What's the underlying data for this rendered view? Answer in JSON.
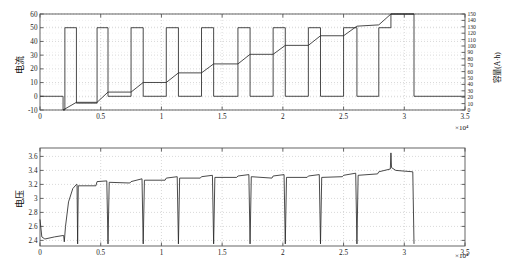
{
  "figure": {
    "background": "#ffffff",
    "line_color": "#2b2b2b",
    "grid_color": "#bdbdbd",
    "axis_color": "#555555"
  },
  "panels": [
    {
      "id": "current",
      "ylabel_left": "电流",
      "ylabel_right": "容量(A·h)",
      "exponent_label": "×10⁴"
    },
    {
      "id": "voltage",
      "ylabel_left": "电压",
      "exponent_label": "×10⁴"
    }
  ],
  "chart_data": [
    {
      "type": "line",
      "title": "",
      "xlabel": "",
      "ylabel": "电流",
      "y2label": "容量(A·h)",
      "grid": true,
      "legend": "none",
      "xlim": [
        0,
        35000
      ],
      "ylim": [
        -10,
        60
      ],
      "y2lim": [
        0,
        150
      ],
      "x_exponent": "×10⁴",
      "xticks": [
        0,
        5000,
        10000,
        15000,
        20000,
        25000,
        30000,
        35000
      ],
      "xticklabels": [
        "0",
        "0.5",
        "1",
        "1.5",
        "2",
        "2.5",
        "3",
        "3.5"
      ],
      "yticks": [
        -10,
        0,
        10,
        20,
        30,
        40,
        50,
        60
      ],
      "yticklabels": [
        "-10",
        "0",
        "10",
        "20",
        "30",
        "40",
        "50",
        "60"
      ],
      "y2ticks": [
        0,
        10,
        20,
        30,
        40,
        50,
        60,
        70,
        80,
        90,
        100,
        110,
        120,
        130,
        140,
        150
      ],
      "y2ticklabels": [
        "0",
        "10",
        "20",
        "30",
        "40",
        "50",
        "60",
        "70",
        "80",
        "90",
        "100",
        "110",
        "120",
        "130",
        "140",
        "150"
      ],
      "series": [
        {
          "name": "电流",
          "axis": "left",
          "description": "Rectangular discharge-pulse current train, baseline 0 A with 50 A pulses; final pulse reaches 60 A",
          "points": [
            [
              0,
              0
            ],
            [
              1900,
              0
            ],
            [
              1900,
              -10
            ],
            [
              2050,
              -10
            ],
            [
              2050,
              50
            ],
            [
              3000,
              50
            ],
            [
              3000,
              -5
            ],
            [
              4700,
              -5
            ],
            [
              4700,
              50
            ],
            [
              5600,
              50
            ],
            [
              5600,
              0
            ],
            [
              7500,
              0
            ],
            [
              7500,
              50
            ],
            [
              8500,
              50
            ],
            [
              8500,
              0
            ],
            [
              10400,
              0
            ],
            [
              10400,
              50
            ],
            [
              11400,
              50
            ],
            [
              11400,
              0
            ],
            [
              13300,
              0
            ],
            [
              13300,
              50
            ],
            [
              14300,
              50
            ],
            [
              14300,
              0
            ],
            [
              16300,
              0
            ],
            [
              16300,
              50
            ],
            [
              17300,
              50
            ],
            [
              17300,
              0
            ],
            [
              19200,
              0
            ],
            [
              19200,
              50
            ],
            [
              20200,
              50
            ],
            [
              20200,
              0
            ],
            [
              22100,
              0
            ],
            [
              22100,
              50
            ],
            [
              23100,
              50
            ],
            [
              23100,
              0
            ],
            [
              25000,
              0
            ],
            [
              25000,
              50
            ],
            [
              26100,
              50
            ],
            [
              26100,
              0
            ],
            [
              27900,
              0
            ],
            [
              27900,
              50
            ],
            [
              28900,
              50
            ],
            [
              28900,
              60
            ],
            [
              30800,
              60
            ],
            [
              30800,
              0
            ],
            [
              35000,
              0
            ]
          ]
        },
        {
          "name": "容量",
          "axis": "right",
          "description": "Monotonic staircase of accumulated capacity rising from 0 to ~150 A·h",
          "points": [
            [
              1900,
              0
            ],
            [
              3000,
              12
            ],
            [
              4700,
              12
            ],
            [
              5600,
              28
            ],
            [
              7500,
              28
            ],
            [
              8500,
              43
            ],
            [
              10400,
              43
            ],
            [
              11400,
              58
            ],
            [
              13300,
              58
            ],
            [
              14300,
              72
            ],
            [
              16300,
              72
            ],
            [
              17300,
              87
            ],
            [
              19200,
              87
            ],
            [
              20200,
              101
            ],
            [
              22100,
              101
            ],
            [
              23100,
              116
            ],
            [
              25000,
              116
            ],
            [
              26100,
              131
            ],
            [
              27900,
              133
            ],
            [
              28900,
              150
            ],
            [
              30800,
              150
            ]
          ]
        }
      ]
    },
    {
      "type": "line",
      "title": "",
      "xlabel": "",
      "ylabel": "电压",
      "grid": true,
      "legend": "none",
      "xlim": [
        0,
        35000
      ],
      "ylim": [
        2.32,
        3.72
      ],
      "x_exponent": "×10⁴",
      "xticks": [
        0,
        5000,
        10000,
        15000,
        20000,
        25000,
        30000,
        35000
      ],
      "xticklabels": [
        "0",
        "0.5",
        "1",
        "1.5",
        "2",
        "2.5",
        "3",
        "3.5"
      ],
      "yticks": [
        2.4,
        2.6,
        2.8,
        3.0,
        3.2,
        3.4,
        3.6
      ],
      "yticklabels": [
        "2.4",
        "2.6",
        "2.8",
        "3",
        "3.2",
        "3.4",
        "3.6"
      ],
      "series": [
        {
          "name": "电压",
          "axis": "left",
          "description": "Cell terminal voltage: initial drop to 2.42 V, recovery to ~3.2 V, slow rise across pulse train with deep vertical drops at each pulse, peak spike 3.65 V near 2.9e4, ends at 3.38 V",
          "points": [
            [
              0,
              2.7
            ],
            [
              150,
              2.45
            ],
            [
              400,
              2.42
            ],
            [
              1200,
              2.45
            ],
            [
              1900,
              2.47
            ],
            [
              1950,
              2.47
            ],
            [
              2000,
              2.38
            ],
            [
              2100,
              2.6
            ],
            [
              2350,
              2.95
            ],
            [
              2700,
              3.14
            ],
            [
              3000,
              3.2
            ],
            [
              3050,
              3.2
            ],
            [
              3100,
              2.35
            ],
            [
              3150,
              3.18
            ],
            [
              4600,
              3.18
            ],
            [
              4700,
              3.24
            ],
            [
              5500,
              3.25
            ],
            [
              5600,
              2.35
            ],
            [
              5700,
              3.23
            ],
            [
              7400,
              3.22
            ],
            [
              7500,
              3.24
            ],
            [
              8400,
              3.28
            ],
            [
              8500,
              2.35
            ],
            [
              8600,
              3.26
            ],
            [
              10300,
              3.26
            ],
            [
              10400,
              3.29
            ],
            [
              11300,
              3.31
            ],
            [
              11400,
              2.35
            ],
            [
              11500,
              3.29
            ],
            [
              13200,
              3.29
            ],
            [
              13300,
              3.31
            ],
            [
              14200,
              3.33
            ],
            [
              14300,
              2.35
            ],
            [
              14400,
              3.3
            ],
            [
              16200,
              3.3
            ],
            [
              16300,
              3.32
            ],
            [
              17200,
              3.34
            ],
            [
              17300,
              2.35
            ],
            [
              17400,
              3.31
            ],
            [
              19100,
              3.29
            ],
            [
              19200,
              3.32
            ],
            [
              20100,
              3.34
            ],
            [
              20200,
              2.35
            ],
            [
              20300,
              3.3
            ],
            [
              22000,
              3.3
            ],
            [
              22100,
              3.32
            ],
            [
              23000,
              3.34
            ],
            [
              23100,
              2.35
            ],
            [
              23200,
              3.3
            ],
            [
              24900,
              3.31
            ],
            [
              25000,
              3.33
            ],
            [
              26000,
              3.36
            ],
            [
              26100,
              2.35
            ],
            [
              26200,
              3.33
            ],
            [
              27800,
              3.35
            ],
            [
              27900,
              3.38
            ],
            [
              28850,
              3.42
            ],
            [
              28900,
              3.65
            ],
            [
              28950,
              3.44
            ],
            [
              29300,
              3.4
            ],
            [
              30700,
              3.38
            ],
            [
              30800,
              2.35
            ]
          ]
        }
      ]
    }
  ]
}
